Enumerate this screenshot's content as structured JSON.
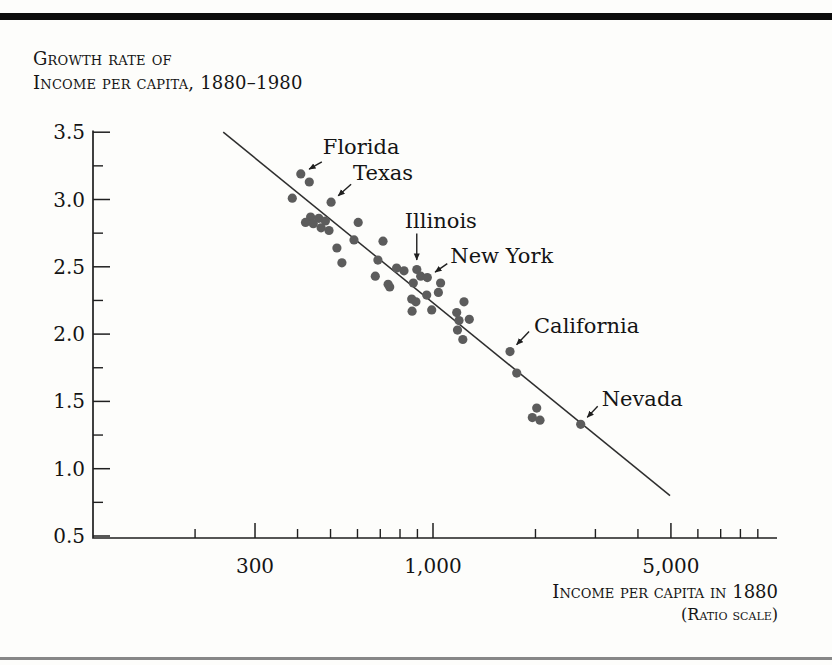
{
  "page": {
    "title_line1": "Growth rate of",
    "title_line2": "Income per capita, 1880–1980",
    "x_axis_title": "Income per capita in 1880",
    "x_axis_subtitle": "(Ratio scale)"
  },
  "chart_data": {
    "type": "scatter",
    "xlabel": "Income per capita in 1880 (ratio scale)",
    "ylabel": "Growth rate of income per capita, 1880-1980",
    "x_scale": "log",
    "xlim": [
      100,
      10000
    ],
    "ylim": [
      0.5,
      3.5
    ],
    "grid": false,
    "x_major_ticks": [
      300,
      1000,
      5000
    ],
    "x_major_tick_labels": [
      "300",
      "1,000",
      "5,000"
    ],
    "x_minor_ticks": [
      200,
      400,
      500,
      600,
      700,
      800,
      900,
      2000,
      3000,
      4000,
      6000,
      7000,
      8000,
      9000
    ],
    "y_major_ticks": [
      0.5,
      1.0,
      1.5,
      2.0,
      2.5,
      3.0,
      3.5
    ],
    "y_major_tick_labels": [
      "0.5",
      "1.0",
      "1.5",
      "2.0",
      "2.5",
      "3.0",
      "3.5"
    ],
    "y_minor_ticks": [
      0.75,
      1.25,
      1.75,
      2.25,
      2.75,
      3.25
    ],
    "points": [
      [
        409,
        3.19
      ],
      [
        433,
        3.13
      ],
      [
        386,
        3.01
      ],
      [
        502,
        2.98
      ],
      [
        437,
        2.87
      ],
      [
        462,
        2.86
      ],
      [
        483,
        2.84
      ],
      [
        422,
        2.83
      ],
      [
        445,
        2.82
      ],
      [
        469,
        2.79
      ],
      [
        495,
        2.77
      ],
      [
        603,
        2.83
      ],
      [
        586,
        2.7
      ],
      [
        713,
        2.69
      ],
      [
        522,
        2.64
      ],
      [
        540,
        2.53
      ],
      [
        689,
        2.55
      ],
      [
        677,
        2.43
      ],
      [
        746,
        2.35
      ],
      [
        782,
        2.49
      ],
      [
        822,
        2.47
      ],
      [
        738,
        2.37
      ],
      [
        896,
        2.48
      ],
      [
        920,
        2.43
      ],
      [
        962,
        2.42
      ],
      [
        875,
        2.38
      ],
      [
        1053,
        2.38
      ],
      [
        958,
        2.29
      ],
      [
        1037,
        2.31
      ],
      [
        866,
        2.26
      ],
      [
        891,
        2.24
      ],
      [
        868,
        2.17
      ],
      [
        991,
        2.18
      ],
      [
        1233,
        2.24
      ],
      [
        1174,
        2.16
      ],
      [
        1278,
        2.11
      ],
      [
        1192,
        2.1
      ],
      [
        1180,
        2.03
      ],
      [
        1223,
        1.96
      ],
      [
        1684,
        1.87
      ],
      [
        1762,
        1.71
      ],
      [
        2017,
        1.45
      ],
      [
        1958,
        1.38
      ],
      [
        2062,
        1.36
      ],
      [
        2716,
        1.33
      ]
    ],
    "trend_line": {
      "from": [
        242,
        3.5
      ],
      "to": [
        4970,
        0.8
      ]
    },
    "annotations": [
      {
        "label": "Florida",
        "point": [
          409,
          3.19
        ],
        "label_offset": [
          22,
          -20
        ],
        "arrow_tail_offset": [
          21,
          -12
        ]
      },
      {
        "label": "Texas",
        "point": [
          502,
          2.98
        ],
        "label_offset": [
          22,
          -22
        ],
        "arrow_tail_offset": [
          20,
          -18
        ]
      },
      {
        "label": "Illinois",
        "point": [
          896,
          2.48
        ],
        "label_offset": [
          -12,
          -41
        ],
        "arrow_tail_offset": [
          0,
          -36
        ]
      },
      {
        "label": "New York",
        "point": [
          962,
          2.42
        ],
        "label_offset": [
          23,
          -15
        ],
        "arrow_tail_offset": [
          20,
          -14
        ]
      },
      {
        "label": "California",
        "point": [
          1684,
          1.87
        ],
        "label_offset": [
          24,
          -19
        ],
        "arrow_tail_offset": [
          19,
          -20
        ]
      },
      {
        "label": "Nevada",
        "point": [
          2716,
          1.33
        ],
        "label_offset": [
          21,
          -18
        ],
        "arrow_tail_offset": [
          17,
          -18
        ]
      }
    ],
    "colors": {
      "point": "#5c5c5c",
      "line": "#2e2e2e",
      "axis": "#1f1f1f",
      "text": "#141414"
    }
  }
}
